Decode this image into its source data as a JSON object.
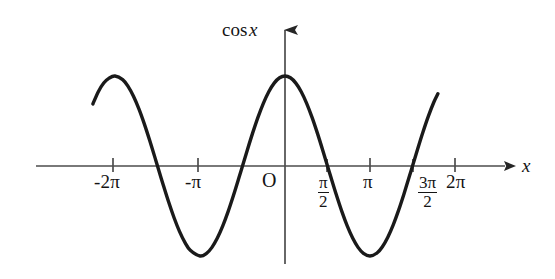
{
  "figure": {
    "kind": "math-function-graph",
    "background_color": "#ffffff",
    "ink_color": "#141414",
    "curve_color": "#1a1a1a",
    "axis_color": "#4a4a4a"
  },
  "axes": {
    "y_axis_label": "cos x",
    "y_axis_label_math": "cos",
    "y_axis_label_var": "x",
    "x_axis_label": "x",
    "origin_label": "O",
    "x_tick_labels": [
      "-2π",
      "-π",
      "π",
      "2π"
    ],
    "x_fraction_ticks": [
      {
        "num": "π",
        "den": "2"
      },
      {
        "num": "3π",
        "den": "2"
      }
    ],
    "x_range_label": "-2π to 2π",
    "arrow_heads": [
      "x-axis-right",
      "y-axis-up"
    ]
  },
  "chart_data": {
    "type": "line",
    "title": "",
    "subtitle": "",
    "xlabel": "x",
    "ylabel": "cos x",
    "function": "y = cos(x)",
    "grid": false,
    "legend": null,
    "xlim": [
      -7.1,
      6.6
    ],
    "ylim": [
      -1.22,
      1.35
    ],
    "x_ticks": [
      -6.283185,
      -3.141593,
      0,
      1.570796,
      3.141593,
      4.712389,
      6.283185
    ],
    "x_tick_labels": [
      "-2π",
      "-π",
      "O",
      "π/2",
      "π",
      "3π/2",
      "2π"
    ],
    "y_ticks": [],
    "y_tick_labels": [],
    "curve_domain": [
      -7.1,
      5.65
    ],
    "series": [
      {
        "name": "cos x",
        "x": [
          -7.1,
          -6.9,
          -6.7,
          -6.5,
          -6.283185,
          -6.0,
          -5.8,
          -5.6,
          -5.4,
          -5.2,
          -5.0,
          -4.8,
          -4.712389,
          -4.5,
          -4.3,
          -4.1,
          -3.9,
          -3.7,
          -3.5,
          -3.141593,
          -2.9,
          -2.7,
          -2.5,
          -2.3,
          -2.1,
          -1.9,
          -1.7,
          -1.570796,
          -1.4,
          -1.2,
          -1.0,
          -0.8,
          -0.6,
          -0.4,
          -0.2,
          0,
          0.2,
          0.4,
          0.6,
          0.8,
          1.0,
          1.2,
          1.4,
          1.570796,
          1.7,
          1.9,
          2.1,
          2.3,
          2.5,
          2.7,
          2.9,
          3.141593,
          3.4,
          3.6,
          3.8,
          4.0,
          4.2,
          4.4,
          4.6,
          4.712389,
          4.9,
          5.1,
          5.3,
          5.5,
          5.65
        ],
        "y": [
          0.6895,
          0.8254,
          0.9219,
          0.9766,
          1.0,
          0.9602,
          0.8855,
          0.7756,
          0.6347,
          0.4685,
          0.2837,
          0.0875,
          0.0,
          -0.2108,
          -0.4008,
          -0.5748,
          -0.7259,
          -0.8481,
          -0.9365,
          -1.0,
          -0.971,
          -0.9041,
          -0.8011,
          -0.6663,
          -0.5048,
          -0.3233,
          -0.1288,
          0.0,
          0.17,
          0.3624,
          0.5403,
          0.6967,
          0.8253,
          0.9211,
          0.9801,
          1.0,
          0.9801,
          0.9211,
          0.8253,
          0.6967,
          0.5403,
          0.3624,
          0.17,
          0.0,
          -0.1288,
          -0.3233,
          -0.5048,
          -0.6663,
          -0.8011,
          -0.9041,
          -0.971,
          -1.0,
          -0.9668,
          -0.8968,
          -0.791,
          -0.6536,
          -0.4903,
          -0.3073,
          -0.1122,
          0.0,
          0.1865,
          0.378,
          0.5544,
          0.7087,
          0.8027
        ],
        "key_points": {
          "maxima_x": [
            -6.283185,
            0,
            6.283185
          ],
          "minima_x": [
            -3.141593,
            3.141593
          ],
          "zeros_x": [
            -4.712389,
            -1.570796,
            1.570796,
            4.712389
          ],
          "amplitude": 1,
          "period": 6.283185
        }
      }
    ]
  }
}
